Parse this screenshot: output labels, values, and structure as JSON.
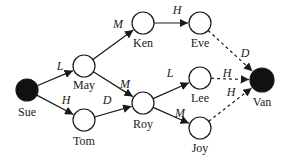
{
  "diagram": {
    "type": "directed-graph",
    "nodes": [
      {
        "id": "sue",
        "label": "Sue",
        "x": 27,
        "y": 90,
        "r": 11,
        "filled": true,
        "lx": 27,
        "ly": 116
      },
      {
        "id": "may",
        "label": "May",
        "x": 84,
        "y": 66,
        "r": 11,
        "filled": false,
        "lx": 84,
        "ly": 89
      },
      {
        "id": "tom",
        "label": "Tom",
        "x": 84,
        "y": 120,
        "r": 11,
        "filled": false,
        "lx": 84,
        "ly": 145
      },
      {
        "id": "ken",
        "label": "Ken",
        "x": 143,
        "y": 23,
        "r": 11,
        "filled": false,
        "lx": 143,
        "ly": 47
      },
      {
        "id": "eve",
        "label": "Eve",
        "x": 200,
        "y": 23,
        "r": 11,
        "filled": false,
        "lx": 200,
        "ly": 47
      },
      {
        "id": "roy",
        "label": "Roy",
        "x": 143,
        "y": 103,
        "r": 11,
        "filled": false,
        "lx": 143,
        "ly": 128
      },
      {
        "id": "lee",
        "label": "Lee",
        "x": 200,
        "y": 78,
        "r": 11,
        "filled": false,
        "lx": 200,
        "ly": 102
      },
      {
        "id": "joy",
        "label": "Joy",
        "x": 200,
        "y": 128,
        "r": 11,
        "filled": false,
        "lx": 200,
        "ly": 152
      },
      {
        "id": "van",
        "label": "Van",
        "x": 262,
        "y": 80,
        "r": 12,
        "filled": true,
        "lx": 262,
        "ly": 106
      }
    ],
    "edges": [
      {
        "from": "sue",
        "to": "may",
        "label": "L",
        "style": "solid",
        "lx": 60,
        "ly": 70
      },
      {
        "from": "sue",
        "to": "tom",
        "label": "H",
        "style": "solid",
        "lx": 66,
        "ly": 104
      },
      {
        "from": "may",
        "to": "ken",
        "label": "M",
        "style": "solid",
        "lx": 118,
        "ly": 28
      },
      {
        "from": "may",
        "to": "roy",
        "label": "M",
        "style": "solid",
        "lx": 125,
        "ly": 88
      },
      {
        "from": "tom",
        "to": "roy",
        "label": "D",
        "style": "solid",
        "lx": 107,
        "ly": 104
      },
      {
        "from": "ken",
        "to": "eve",
        "label": "H",
        "style": "solid",
        "lx": 177,
        "ly": 14
      },
      {
        "from": "roy",
        "to": "lee",
        "label": "L",
        "style": "solid",
        "lx": 170,
        "ly": 77
      },
      {
        "from": "roy",
        "to": "joy",
        "label": "M",
        "style": "solid",
        "lx": 180,
        "ly": 117
      },
      {
        "from": "eve",
        "to": "van",
        "label": "D",
        "style": "dashed",
        "lx": 245,
        "ly": 57
      },
      {
        "from": "lee",
        "to": "van",
        "label": "H",
        "style": "dashed",
        "lx": 227,
        "ly": 77
      },
      {
        "from": "joy",
        "to": "van",
        "label": "H",
        "style": "dashed",
        "lx": 231,
        "ly": 96
      }
    ],
    "colors": {
      "stroke": "#1a1a1a",
      "filled_node": "#111111",
      "open_node": "#ffffff"
    }
  }
}
